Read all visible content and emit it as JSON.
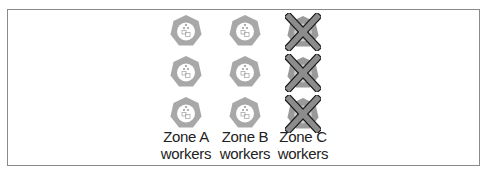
{
  "diagram": {
    "title": "",
    "zones": [
      {
        "label_line1": "Zone A",
        "label_line2": "workers",
        "status": "healthy",
        "node_count": 3
      },
      {
        "label_line1": "Zone B",
        "label_line2": "workers",
        "status": "healthy",
        "node_count": 3
      },
      {
        "label_line1": "Zone C",
        "label_line2": "workers",
        "status": "failed",
        "node_count": 3
      }
    ],
    "icons": {
      "node": "kubernetes-node-heptagon-icon",
      "failed_overlay": "x-cross-icon"
    },
    "colors": {
      "node_fill": "#a8a8a8",
      "node_inner": "#ffffff",
      "cross_fill": "#8c8c8c",
      "cross_stroke": "#1a1a1a",
      "border": "#8a8a8a",
      "text": "#222222"
    }
  }
}
